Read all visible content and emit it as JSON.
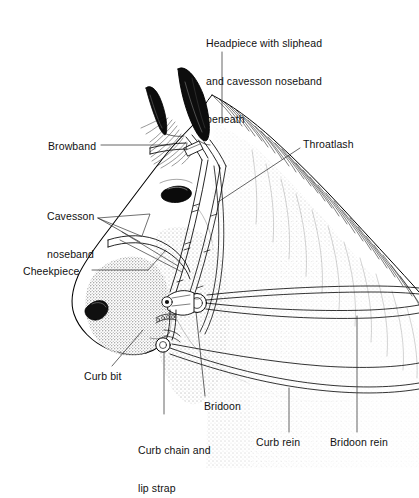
{
  "figure": {
    "background_color": "#ffffff",
    "ink_color": "#000000",
    "style": "black-and-white pen-and-ink line illustration with stipple shading"
  },
  "labels": [
    {
      "name": "headpiece",
      "text": "Headpiece with sliphead\nand cavesson noseband\nbeneath",
      "line1": "Headpiece with sliphead",
      "line2": "and cavesson noseband",
      "line3": "beneath",
      "x": 206,
      "y": 12,
      "align": "left"
    },
    {
      "name": "browband",
      "text": "Browband",
      "x": 48,
      "y": 140,
      "align": "left"
    },
    {
      "name": "throatlash",
      "text": "Throatlash",
      "x": 303,
      "y": 138,
      "align": "left"
    },
    {
      "name": "cavesson-noseband",
      "text": "Cavesson\nnoseband",
      "line1": "Cavesson",
      "line2": "noseband",
      "x": 47,
      "y": 185,
      "align": "left"
    },
    {
      "name": "cheekpiece",
      "text": "Cheekpiece",
      "x": 23,
      "y": 265,
      "align": "left"
    },
    {
      "name": "curb-bit",
      "text": "Curb bit",
      "x": 84,
      "y": 370,
      "align": "left"
    },
    {
      "name": "bridoon",
      "text": "Bridoon",
      "x": 204,
      "y": 400,
      "align": "left"
    },
    {
      "name": "curb-chain-lip-strap",
      "text": "Curb chain and\nlip strap",
      "line1": "Curb chain and",
      "line2": "lip strap",
      "x": 138,
      "y": 419,
      "align": "left"
    },
    {
      "name": "curb-rein",
      "text": "Curb rein",
      "x": 256,
      "y": 436,
      "align": "left"
    },
    {
      "name": "bridoon-rein",
      "text": "Bridoon rein",
      "x": 330,
      "y": 436,
      "align": "left"
    }
  ]
}
